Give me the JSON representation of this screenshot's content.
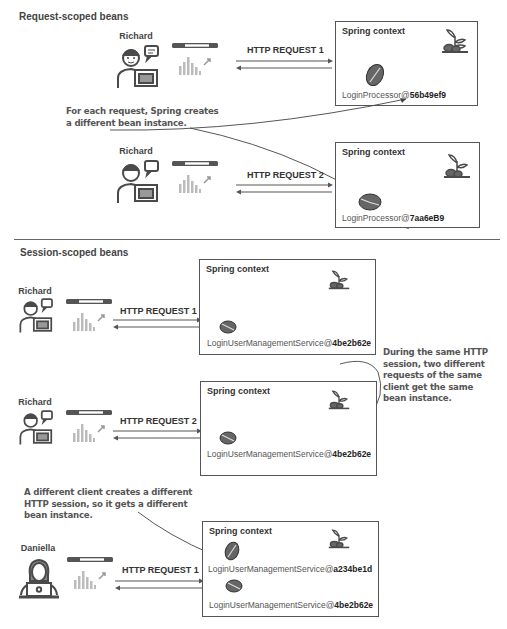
{
  "sections": {
    "request": {
      "title": "Request-scoped beans",
      "rows": [
        {
          "client": "Richard",
          "request_label": "HTTP REQUEST 1",
          "context_title": "Spring context",
          "beans": [
            {
              "name": "LoginProcessor@",
              "id": "56b49ef9"
            }
          ]
        },
        {
          "client": "Richard",
          "request_label": "HTTP REQUEST 2",
          "context_title": "Spring context",
          "beans": [
            {
              "name": "LoginProcessor@",
              "id": "7aa6eB9"
            }
          ]
        }
      ],
      "note_lines": [
        "For each request, Spring creates",
        "a different bean instance."
      ]
    },
    "session": {
      "title": "Session-scoped beans",
      "rows": [
        {
          "client": "Richard",
          "request_label": "HTTP REQUEST 1",
          "context_title": "Spring context",
          "beans": [
            {
              "name": "LoginUserManagementService@",
              "id": "4be2b62e"
            }
          ]
        },
        {
          "client": "Richard",
          "request_label": "HTTP REQUEST 2",
          "context_title": "Spring context",
          "beans": [
            {
              "name": "LoginUserManagementService@",
              "id": "4be2b62e"
            }
          ]
        },
        {
          "client": "Daniella",
          "request_label": "HTTP REQUEST 1",
          "context_title": "Spring context",
          "beans": [
            {
              "name": "LoginUserManagementService@",
              "id": "a234be1d"
            },
            {
              "name": "LoginUserManagementService@",
              "id": "4be2b62e"
            }
          ]
        }
      ],
      "note_same_session_lines": [
        "During the same HTTP",
        "session, two different",
        "requests of the same",
        "client get the same",
        "bean instance."
      ],
      "note_different_client_lines": [
        "A different client creates a different",
        "HTTP session, so it gets a different",
        "bean instance."
      ]
    }
  },
  "icons": {
    "client": "person-at-laptop-icon",
    "browser": "browser-window-icon",
    "bean": "coffee-bean-icon",
    "plant": "coffee-plant-icon"
  },
  "colors": {
    "line": "#555555",
    "text": "#333333",
    "icon": "#4a4a4a",
    "note": "#555555"
  }
}
